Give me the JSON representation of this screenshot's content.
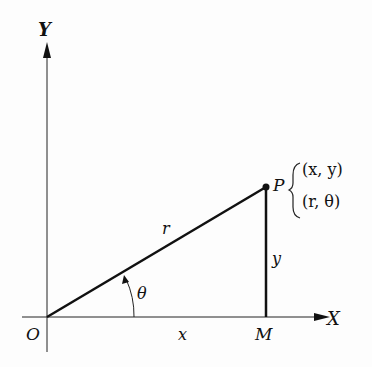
{
  "diagram": {
    "axes": {
      "y_label": "Y",
      "x_label": "X",
      "origin_label": "O"
    },
    "point": {
      "label": "P",
      "cartesian": "(x, y)",
      "polar": "(r, θ)"
    },
    "foot_label": "M",
    "segments": {
      "radius": "r",
      "horizontal": "x",
      "vertical": "y",
      "angle": "θ"
    }
  }
}
